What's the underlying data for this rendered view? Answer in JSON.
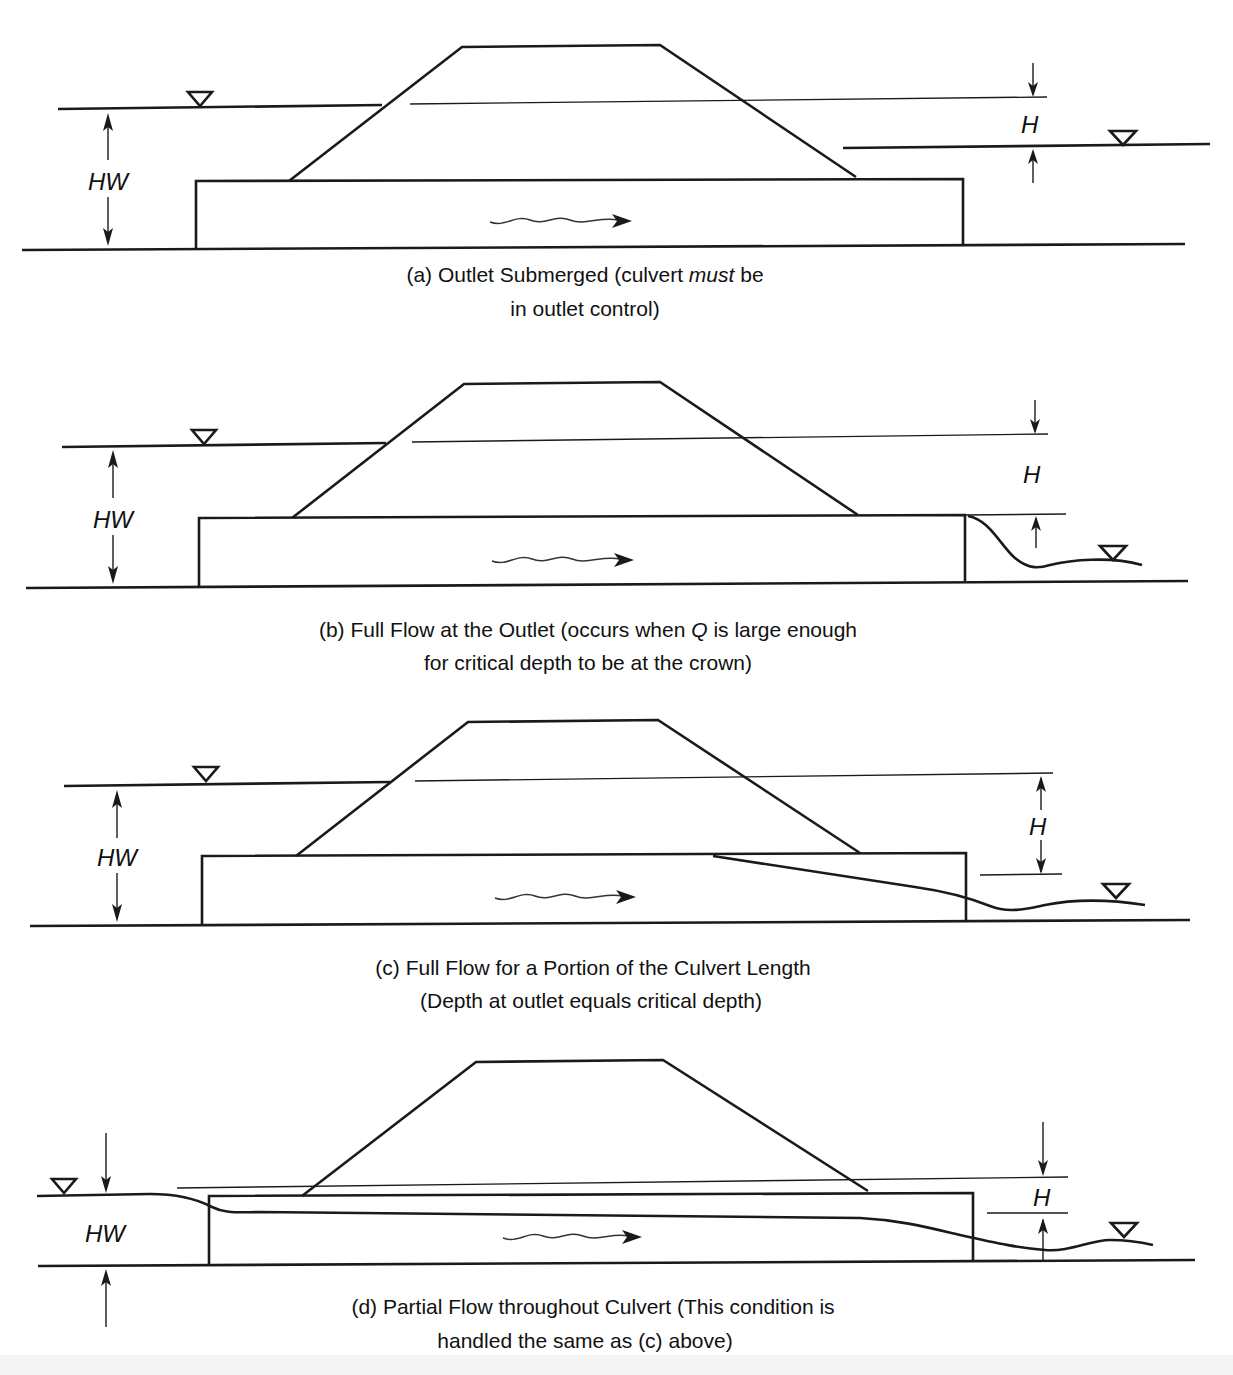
{
  "figure": {
    "type": "culvert outlet-control flow conditions",
    "panels": [
      {
        "id": "a",
        "labels": {
          "headwater": "HW",
          "head": "H"
        },
        "caption_line1_pre": "(a) Outlet Submerged (culvert ",
        "caption_line1_em": "must",
        "caption_line1_post": " be",
        "caption_line2": "in outlet control)"
      },
      {
        "id": "b",
        "labels": {
          "headwater": "HW",
          "head": "H"
        },
        "caption_line1_pre": "(b) Full Flow at the Outlet (occurs when ",
        "caption_line1_em": "Q",
        "caption_line1_post": " is large enough",
        "caption_line2": "for critical depth to be at the crown)"
      },
      {
        "id": "c",
        "labels": {
          "headwater": "HW",
          "head": "H"
        },
        "caption_line1": "(c) Full Flow for a Portion of the Culvert Length",
        "caption_line2": "(Depth at outlet equals critical depth)"
      },
      {
        "id": "d",
        "labels": {
          "headwater": "HW",
          "head": "H"
        },
        "caption_line1": "(d) Partial Flow throughout Culvert (This condition is",
        "caption_line2": "handled the same as (c) above)"
      }
    ],
    "symbols": {
      "water_surface": "inverted-triangle",
      "flow_direction": "wavy-arrow-right"
    }
  }
}
